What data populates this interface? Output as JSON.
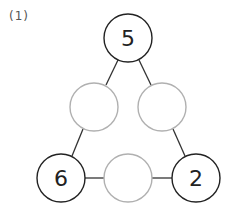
{
  "problem_label": "(1)",
  "circles": {
    "top": "5",
    "left_middle": "",
    "right_middle": "",
    "bottom_left": "6",
    "bottom_middle": "",
    "bottom_right": "2"
  },
  "colors": {
    "given_circle_stroke": "#222222",
    "empty_circle_stroke": "#b0b0b0",
    "line": "#333333"
  }
}
